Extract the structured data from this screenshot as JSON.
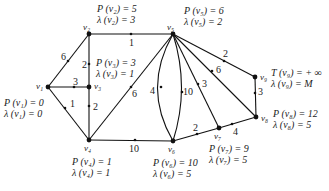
{
  "nodes": [
    {
      "id": "v1",
      "label": "v1",
      "x": 48,
      "y": 87
    },
    {
      "id": "v2",
      "label": "v2",
      "x": 89,
      "y": 34
    },
    {
      "id": "v3",
      "label": "v3",
      "x": 89,
      "y": 87
    },
    {
      "id": "v4",
      "label": "v4",
      "x": 89,
      "y": 140
    },
    {
      "id": "v5",
      "label": "v5",
      "x": 173,
      "y": 34
    },
    {
      "id": "v6",
      "label": "v6",
      "x": 173,
      "y": 141
    },
    {
      "id": "v7",
      "label": "v7",
      "x": 219,
      "y": 128
    },
    {
      "id": "v8",
      "label": "v8",
      "x": 256,
      "y": 117
    },
    {
      "id": "v9",
      "label": "v9",
      "x": 255,
      "y": 77
    }
  ],
  "edges": [
    {
      "from": "v1",
      "to": "v2",
      "weight": "6"
    },
    {
      "from": "v1",
      "to": "v3",
      "weight": "3"
    },
    {
      "from": "v1",
      "to": "v4",
      "weight": "1"
    },
    {
      "from": "v2",
      "to": "v5",
      "weight": "1"
    },
    {
      "from": "v2",
      "to": "v3",
      "weight": "2"
    },
    {
      "from": "v3",
      "to": "v4",
      "weight": "2"
    },
    {
      "from": "v4",
      "to": "v5",
      "weight": "6"
    },
    {
      "from": "v4",
      "to": "v6",
      "weight": "10"
    },
    {
      "from": "v5",
      "to": "v6",
      "weight": "4",
      "curve": "left"
    },
    {
      "from": "v6",
      "to": "v5",
      "weight": "10",
      "curve": "right"
    },
    {
      "from": "v5",
      "to": "v7",
      "weight": "3"
    },
    {
      "from": "v5",
      "to": "v8",
      "weight": "6"
    },
    {
      "from": "v5",
      "to": "v9",
      "weight": "2"
    },
    {
      "from": "v6",
      "to": "v7",
      "weight": "2"
    },
    {
      "from": "v7",
      "to": "v8",
      "weight": "4"
    },
    {
      "from": "v8",
      "to": "v9",
      "weight": "3"
    }
  ],
  "annotations": {
    "v1": {
      "P": "P (v₁) = 0",
      "L": "λ (v₁) = 0"
    },
    "v2": {
      "P": "P (v₂) = 5",
      "L": "λ (v₂) = 3"
    },
    "v3": {
      "P": "P (v₃) = 3",
      "L": "λ (v₃) = 1"
    },
    "v4": {
      "P": "P (v₄) = 1",
      "L": "λ (v₄) = 1"
    },
    "v5": {
      "P": "P (v₅) = 6",
      "L": "λ (v₅) = 2"
    },
    "v6": {
      "P": "P (v₆) = 10",
      "L": "λ (v₆) = 5"
    },
    "v7": {
      "P": "P (v₇) = 9",
      "L": "λ (v₇) = 5"
    },
    "v8": {
      "P": "P (v₈) = 12",
      "L": "λ (v₈) = 5"
    },
    "v9": {
      "P": "T (v₉) = + ∞",
      "L": "λ (v₉) = M"
    }
  },
  "node_labels": {
    "v1": "v₁",
    "v2": "v₂",
    "v3": "v₃",
    "v4": "v₄",
    "v5": "v₅",
    "v6": "v₆",
    "v7": "v₇",
    "v8": "v₈",
    "v9": "v₉"
  },
  "weights": {
    "e12": "6",
    "e13": "3",
    "e14": "1",
    "e25": "1",
    "e23": "2",
    "e34": "2",
    "e45": "6",
    "e46": "10",
    "e56a": "4",
    "e56b": "10",
    "e57": "3",
    "e58": "6",
    "e59": "2",
    "e67": "2",
    "e78": "4",
    "e89": "3"
  }
}
